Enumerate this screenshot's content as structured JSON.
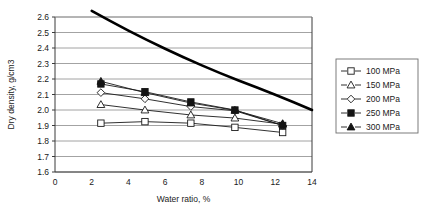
{
  "chart_data": {
    "type": "line",
    "title": "",
    "xlabel": "Water ratio, %",
    "ylabel": "Dry density, g/cm3",
    "xlim": [
      0,
      14
    ],
    "ylim": [
      1.6,
      2.6
    ],
    "xticks": [
      "0",
      "2",
      "4",
      "6",
      "8",
      "10",
      "12",
      "14"
    ],
    "yticks": [
      "1.6",
      "1.7",
      "1.8",
      "1.9",
      "2.0",
      "2.1",
      "2.2",
      "2.3",
      "2.4",
      "2.5",
      "2.6"
    ],
    "grid": "horizontal",
    "legend_position": "right-outside",
    "series": [
      {
        "name": "100 MPa",
        "marker": "open-square",
        "x": [
          2.5,
          4.9,
          7.4,
          9.8,
          12.4
        ],
        "values": [
          1.915,
          1.925,
          1.915,
          1.888,
          1.855
        ]
      },
      {
        "name": "150 MPa",
        "marker": "open-triangle",
        "x": [
          2.5,
          4.9,
          7.4,
          9.8,
          12.4
        ],
        "values": [
          2.035,
          2.0,
          1.968,
          1.948,
          1.908
        ]
      },
      {
        "name": "200 MPa",
        "marker": "open-diamond",
        "x": [
          2.5,
          4.9,
          7.4,
          9.8,
          12.4
        ],
        "values": [
          2.112,
          2.072,
          2.022,
          1.995,
          1.9
        ]
      },
      {
        "name": "250 MPa",
        "marker": "filled-square",
        "x": [
          2.5,
          4.9,
          7.4,
          9.8,
          12.4
        ],
        "values": [
          2.168,
          2.118,
          2.052,
          2.0,
          1.9
        ]
      },
      {
        "name": "300 MPa",
        "marker": "filled-triangle",
        "x": [
          2.5,
          4.9,
          7.4,
          9.8,
          12.4
        ],
        "values": [
          2.185,
          2.112,
          2.045,
          1.998,
          1.912
        ]
      }
    ],
    "saturation_curve": {
      "name": "saturation-line",
      "style": "thick-solid-black",
      "x": [
        2.0,
        3.0,
        4.0,
        5.0,
        6.0,
        7.0,
        8.0,
        9.0,
        10.0,
        11.0,
        12.0,
        13.0,
        14.0
      ],
      "values": [
        2.64,
        2.575,
        2.512,
        2.452,
        2.395,
        2.34,
        2.288,
        2.238,
        2.19,
        2.145,
        2.098,
        2.05,
        2.0
      ]
    }
  },
  "legend": {
    "entries": [
      {
        "label": "100 MPa"
      },
      {
        "label": "150 MPa"
      },
      {
        "label": "200 MPa"
      },
      {
        "label": "250 MPa"
      },
      {
        "label": "300 MPa"
      }
    ]
  },
  "colors": {
    "axis": "#3a3a3a",
    "grid": "#8c8c8c",
    "series": "#1a1a1a",
    "saturation": "#000000",
    "background": "#ffffff"
  }
}
